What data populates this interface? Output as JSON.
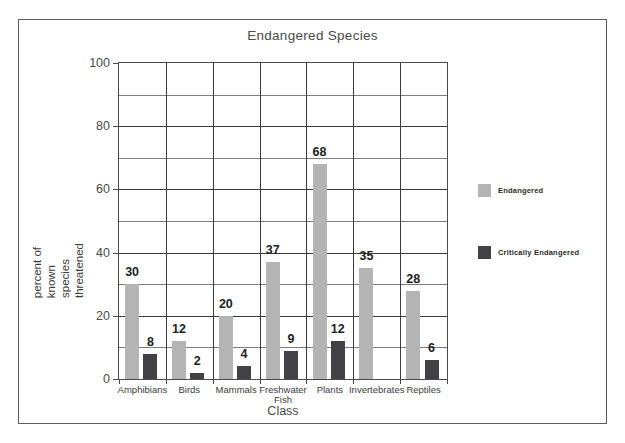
{
  "chart_data": {
    "type": "bar",
    "title": "Endangered Species",
    "xlabel": "Class",
    "ylabel": "percent of known species threatened",
    "ylabel_lines": [
      "percent of",
      "known",
      "species",
      "threatened"
    ],
    "ylim": [
      0,
      100
    ],
    "yticks": [
      0,
      20,
      40,
      60,
      80,
      100
    ],
    "ytick_labels": [
      "0",
      "20",
      "40",
      "60",
      "80",
      "100"
    ],
    "minor_gridline_step": 10,
    "grid": true,
    "legend_position": "right",
    "categories": [
      "Amphibians",
      "Birds",
      "Mammals",
      "Freshwater Fish",
      "Plants",
      "Invertebrates",
      "Reptiles"
    ],
    "category_label_lines": [
      [
        "Amphibians"
      ],
      [
        "Birds"
      ],
      [
        "Mammals"
      ],
      [
        "Freshwater",
        "Fish"
      ],
      [
        "Plants"
      ],
      [
        "Invertebrates"
      ],
      [
        "Reptiles"
      ]
    ],
    "series": [
      {
        "name": "Endangered",
        "color": "#b4b4b4",
        "values": [
          30,
          12,
          20,
          37,
          68,
          35,
          28
        ],
        "labels": [
          "30",
          "12",
          "20",
          "37",
          "68",
          "35",
          "28"
        ]
      },
      {
        "name": "Critically Endangered",
        "color": "#414146",
        "values": [
          8,
          2,
          4,
          9,
          12,
          null,
          6
        ],
        "labels": [
          "8",
          "2",
          "4",
          "9",
          "12",
          "",
          "6"
        ]
      }
    ]
  },
  "figure": {
    "frame_color": "#5c5c5c",
    "axis_color": "#4a4a4a",
    "grid_color": "#7d7d7d",
    "background": "#ffffff"
  }
}
